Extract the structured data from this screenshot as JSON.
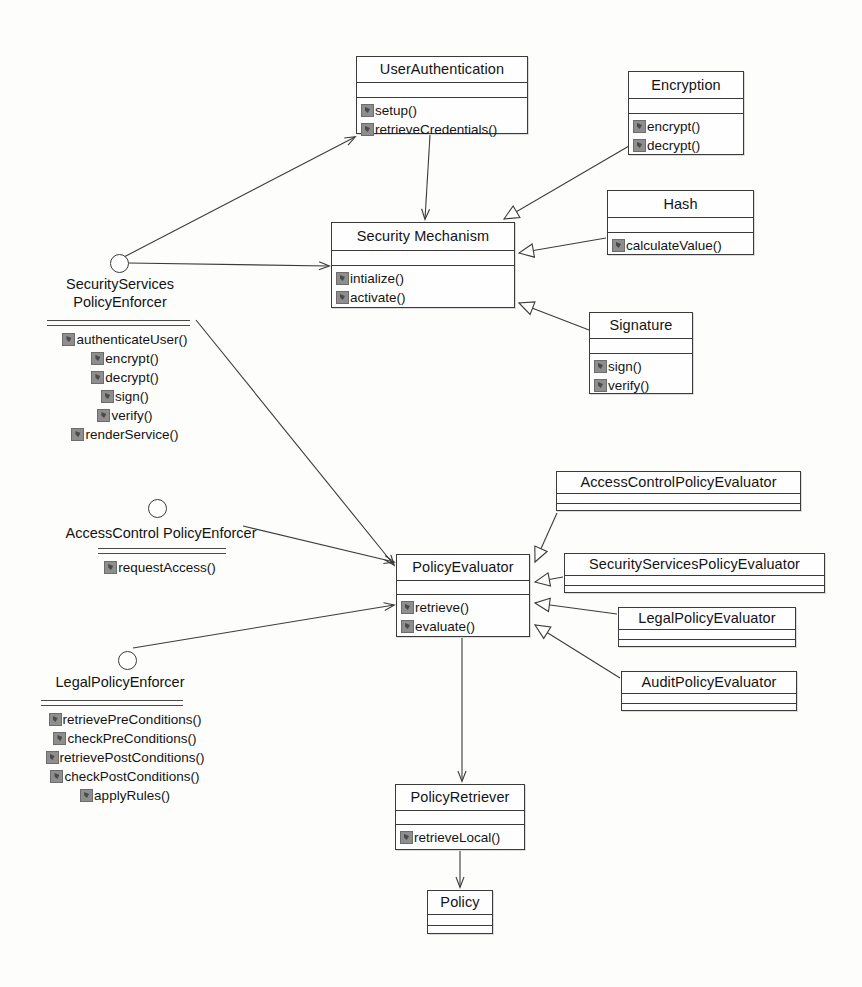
{
  "diagram": {
    "type": "uml-class-diagram",
    "background_color": "#fdfdfc",
    "line_color": "#3b3b3b"
  },
  "classes": [
    {
      "id": "user-authentication",
      "name": "UserAuthentication",
      "attributes": [],
      "operations": [
        "setup()",
        "retrieveCredentials()"
      ],
      "x": 356,
      "y": 56,
      "width": 172,
      "height": 78,
      "name_h": 26,
      "attr_h": 14
    },
    {
      "id": "encryption",
      "name": "Encryption",
      "attributes": [],
      "operations": [
        "encrypt()",
        "decrypt()"
      ],
      "x": 628,
      "y": 71,
      "width": 116,
      "height": 84,
      "name_h": 27,
      "attr_h": 14
    },
    {
      "id": "hash",
      "name": "Hash",
      "attributes": [],
      "operations": [
        "calculateValue()"
      ],
      "x": 607,
      "y": 190,
      "width": 147,
      "height": 65,
      "name_h": 27,
      "attr_h": 14
    },
    {
      "id": "security-mechanism",
      "name": "Security Mechanism",
      "attributes": [],
      "operations": [
        "intialize()",
        "activate()"
      ],
      "x": 331,
      "y": 222,
      "width": 184,
      "height": 86,
      "name_h": 28,
      "attr_h": 14
    },
    {
      "id": "signature",
      "name": "Signature",
      "attributes": [],
      "operations": [
        "sign()",
        "verify()"
      ],
      "x": 589,
      "y": 312,
      "width": 104,
      "height": 82,
      "name_h": 26,
      "attr_h": 14
    },
    {
      "id": "access-control-policy-evaluator",
      "name": "AccessControlPolicyEvaluator",
      "attributes": [],
      "operations": [],
      "x": 556,
      "y": 471,
      "width": 245,
      "height": 40,
      "name_h": 22,
      "attr_h": 9
    },
    {
      "id": "security-services-policy-evaluator",
      "name": "SecurityServicesPolicyEvaluator",
      "attributes": [],
      "operations": [],
      "x": 564,
      "y": 553,
      "width": 261,
      "height": 40,
      "name_h": 22,
      "attr_h": 9
    },
    {
      "id": "legal-policy-evaluator",
      "name": "LegalPolicyEvaluator",
      "attributes": [],
      "operations": [],
      "x": 618,
      "y": 607,
      "width": 178,
      "height": 40,
      "name_h": 22,
      "attr_h": 9
    },
    {
      "id": "audit-policy-evaluator",
      "name": "AuditPolicyEvaluator",
      "attributes": [],
      "operations": [],
      "x": 621,
      "y": 671,
      "width": 176,
      "height": 40,
      "name_h": 22,
      "attr_h": 9
    },
    {
      "id": "policy-evaluator",
      "name": "PolicyEvaluator",
      "attributes": [],
      "operations": [
        "retrieve()",
        "evaluate()"
      ],
      "x": 396,
      "y": 554,
      "width": 134,
      "height": 83,
      "name_h": 26,
      "attr_h": 13
    },
    {
      "id": "policy-retriever",
      "name": "PolicyRetriever",
      "attributes": [],
      "operations": [
        "retrieveLocal()"
      ],
      "x": 395,
      "y": 784,
      "width": 130,
      "height": 66,
      "name_h": 26,
      "attr_h": 13
    },
    {
      "id": "policy",
      "name": "Policy",
      "attributes": [],
      "operations": [],
      "x": 427,
      "y": 890,
      "width": 66,
      "height": 44,
      "name_h": 24,
      "attr_h": 10
    }
  ],
  "interfaces": [
    {
      "id": "security-services-policy-enforcer",
      "name": "SecurityServices\nPolicyEnforcer",
      "circle_x": 110,
      "circle_y": 254,
      "title_x": 35,
      "title_y": 275,
      "title_w": 170,
      "rules_x": 47,
      "rules_y": 320,
      "rules_w": 143,
      "ops_x": 45,
      "ops_y": 330,
      "ops_w": 160,
      "align": "center",
      "operations": [
        "authenticateUser()",
        "encrypt()",
        "decrypt()",
        "sign()",
        "verify()",
        "renderService()"
      ]
    },
    {
      "id": "access-control-policy-enforcer",
      "name": "AccessControl PolicyEnforcer",
      "circle_x": 148,
      "circle_y": 499,
      "title_x": 55,
      "title_y": 524,
      "title_w": 212,
      "rules_x": 98,
      "rules_y": 548,
      "rules_w": 128,
      "ops_x": 85,
      "ops_y": 558,
      "ops_w": 150,
      "align": "center",
      "operations": [
        "requestAccess()"
      ]
    },
    {
      "id": "legal-policy-enforcer",
      "name": "LegalPolicyEnforcer",
      "circle_x": 118,
      "circle_y": 651,
      "title_x": 35,
      "title_y": 673,
      "title_w": 170,
      "rules_x": 41,
      "rules_y": 700,
      "rules_w": 142,
      "ops_x": 40,
      "ops_y": 710,
      "ops_w": 170,
      "align": "center",
      "operations": [
        "retrievePreConditions()",
        "checkPreConditions()",
        "retrievePostConditions()",
        "checkPostConditions()",
        "applyRules()"
      ]
    }
  ],
  "relationships": [
    {
      "from": "security-services-policy-enforcer",
      "to": "user-authentication",
      "type": "association-arrow"
    },
    {
      "from": "security-services-policy-enforcer",
      "to": "security-mechanism",
      "type": "association-arrow"
    },
    {
      "from": "security-services-policy-enforcer",
      "to": "policy-evaluator",
      "type": "association-arrow"
    },
    {
      "from": "user-authentication",
      "to": "security-mechanism",
      "type": "association-arrow"
    },
    {
      "from": "encryption",
      "to": "security-mechanism",
      "type": "generalization"
    },
    {
      "from": "hash",
      "to": "security-mechanism",
      "type": "generalization"
    },
    {
      "from": "signature",
      "to": "security-mechanism",
      "type": "generalization"
    },
    {
      "from": "access-control-policy-enforcer",
      "to": "policy-evaluator",
      "type": "association-arrow"
    },
    {
      "from": "legal-policy-enforcer",
      "to": "policy-evaluator",
      "type": "association-arrow"
    },
    {
      "from": "access-control-policy-evaluator",
      "to": "policy-evaluator",
      "type": "generalization"
    },
    {
      "from": "security-services-policy-evaluator",
      "to": "policy-evaluator",
      "type": "generalization"
    },
    {
      "from": "legal-policy-evaluator",
      "to": "policy-evaluator",
      "type": "generalization"
    },
    {
      "from": "audit-policy-evaluator",
      "to": "policy-evaluator",
      "type": "generalization"
    },
    {
      "from": "policy-evaluator",
      "to": "policy-retriever",
      "type": "association-arrow"
    },
    {
      "from": "policy-retriever",
      "to": "policy",
      "type": "association-arrow"
    }
  ],
  "edges_geometry": [
    {
      "name": "enforcer-to-userauth",
      "kind": "arrow",
      "points": "122,258 355,137"
    },
    {
      "name": "enforcer-to-securitymechanism",
      "kind": "arrow",
      "points": "128,263 329,266"
    },
    {
      "name": "enforcer-to-policyevaluator",
      "kind": "arrow",
      "points": "196,320 394,565"
    },
    {
      "name": "userauth-to-securitymechanism",
      "kind": "arrow",
      "points": "430,135 425,219"
    },
    {
      "name": "encryption-to-securitymechanism",
      "kind": "tri",
      "points": "629,146 504,219"
    },
    {
      "name": "hash-to-securitymechanism",
      "kind": "tri",
      "points": "606,238 519,253"
    },
    {
      "name": "signature-to-securitymechanism",
      "kind": "tri",
      "points": "589,330 519,303"
    },
    {
      "name": "accesscontrol-to-policyevaluator",
      "kind": "arrow",
      "points": "243,526 394,562"
    },
    {
      "name": "legalenforcer-to-policyevaluator",
      "kind": "arrow",
      "points": "133,648 394,605"
    },
    {
      "name": "acpe-to-policyevaluator",
      "kind": "tri",
      "points": "557,513 535,562"
    },
    {
      "name": "sspe-to-policyevaluator",
      "kind": "tri",
      "points": "563,577 535,582"
    },
    {
      "name": "lpe-to-policyevaluator",
      "kind": "tri",
      "points": "617,614 535,603"
    },
    {
      "name": "ape-to-policyevaluator",
      "kind": "tri",
      "points": "620,678 535,625"
    },
    {
      "name": "policyevaluator-to-retriever",
      "kind": "arrow",
      "points": "462,638 462,781"
    },
    {
      "name": "retriever-to-policy",
      "kind": "arrow",
      "points": "460,851 460,887"
    }
  ]
}
